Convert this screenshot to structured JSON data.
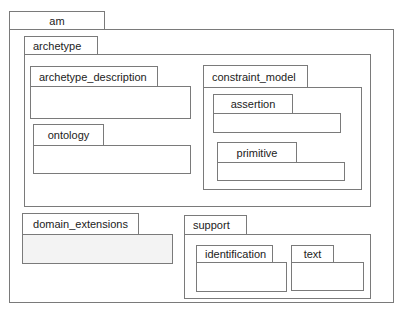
{
  "diagram": {
    "type": "uml-package-diagram",
    "packages": [
      {
        "id": "am",
        "label": "am",
        "tab": [
          9,
          11,
          96,
          19
        ],
        "body": [
          9,
          29,
          385,
          274
        ],
        "align": "center"
      },
      {
        "id": "archetype",
        "label": "archetype",
        "parent": "am",
        "tab": [
          24,
          36,
          74,
          19
        ],
        "body": [
          24,
          54,
          347,
          153
        ],
        "align": "left"
      },
      {
        "id": "archetype_description",
        "label": "archetype_description",
        "parent": "archetype",
        "tab": [
          30,
          66,
          128,
          21
        ],
        "body": [
          30,
          86,
          161,
          33
        ],
        "align": "left"
      },
      {
        "id": "ontology",
        "label": "ontology",
        "parent": "archetype",
        "tab": [
          33,
          124,
          71,
          22
        ],
        "body": [
          33,
          145,
          158,
          29
        ],
        "align": "center"
      },
      {
        "id": "constraint_model",
        "label": "constraint_model",
        "parent": "archetype",
        "tab": [
          203,
          65,
          105,
          23
        ],
        "body": [
          203,
          87,
          159,
          103
        ],
        "align": "left"
      },
      {
        "id": "assertion",
        "label": "assertion",
        "parent": "constraint_model",
        "tab": [
          213,
          94,
          80,
          20
        ],
        "body": [
          213,
          113,
          128,
          20
        ],
        "align": "center"
      },
      {
        "id": "primitive",
        "label": "primitive",
        "parent": "constraint_model",
        "tab": [
          217,
          142,
          80,
          21
        ],
        "body": [
          217,
          162,
          128,
          19
        ],
        "align": "center"
      },
      {
        "id": "domain_extensions",
        "label": "domain_extensions",
        "parent": "am",
        "tab": [
          22,
          213,
          117,
          22
        ],
        "body": [
          22,
          234,
          151,
          30
        ],
        "align": "center",
        "shaded": true
      },
      {
        "id": "support",
        "label": "support",
        "parent": "am",
        "tab": [
          184,
          215,
          63,
          20
        ],
        "body": [
          184,
          234,
          187,
          65
        ],
        "align": "left"
      },
      {
        "id": "identification",
        "label": "identification",
        "parent": "support",
        "tab": [
          196,
          245,
          77,
          18
        ],
        "body": [
          196,
          262,
          91,
          30
        ],
        "align": "left"
      },
      {
        "id": "text",
        "label": "text",
        "parent": "support",
        "tab": [
          291,
          245,
          43,
          18
        ],
        "body": [
          291,
          262,
          73,
          29
        ],
        "align": "center"
      }
    ]
  },
  "colors": {
    "border": "#7a7a7a",
    "fill": "#ffffff",
    "shaded_fill": "#f3f3f3",
    "text": "#222222"
  }
}
